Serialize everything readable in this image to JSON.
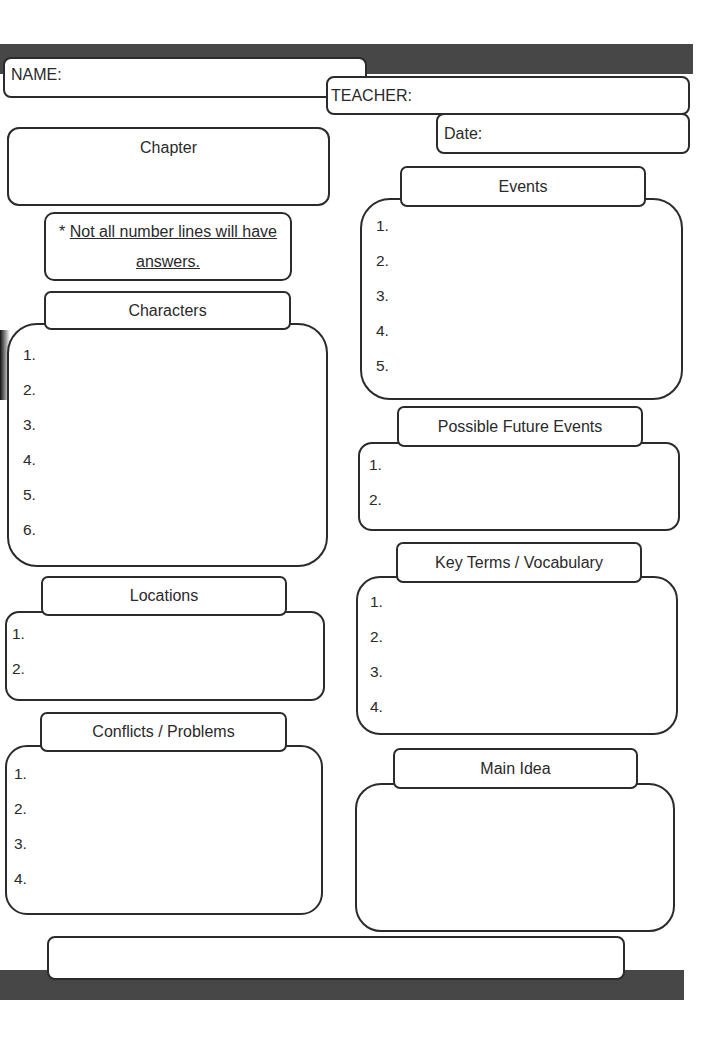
{
  "header": {
    "name_label": "NAME:",
    "teacher_label": "TEACHER:",
    "date_label": "Date:"
  },
  "chapter": {
    "title": "Chapter"
  },
  "note": {
    "prefix": "* ",
    "line1": "Not all number lines will have",
    "line2": "answers."
  },
  "sections": {
    "characters": {
      "title": "Characters",
      "items": [
        "1.",
        "2.",
        "3.",
        "4.",
        "5.",
        "6."
      ]
    },
    "locations": {
      "title": "Locations",
      "items": [
        "1.",
        "2."
      ]
    },
    "conflicts": {
      "title": "Conflicts / Problems",
      "items": [
        "1.",
        "2.",
        "3.",
        "4."
      ]
    },
    "events": {
      "title": "Events",
      "items": [
        "1.",
        "2.",
        "3.",
        "4.",
        "5."
      ]
    },
    "future_events": {
      "title": "Possible Future Events",
      "items": [
        "1.",
        "2."
      ]
    },
    "key_terms": {
      "title": "Key Terms / Vocabulary",
      "items": [
        "1.",
        "2.",
        "3.",
        "4."
      ]
    },
    "main_idea": {
      "title": "Main Idea"
    }
  },
  "colors": {
    "bar": "#474747",
    "border": "#2b2b2b",
    "text": "#2a2a2a",
    "background": "#ffffff"
  }
}
